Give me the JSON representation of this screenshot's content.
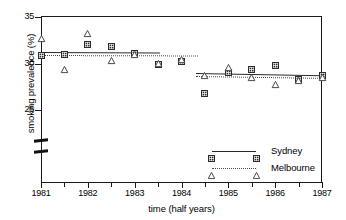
{
  "chart_data": {
    "type": "scatter",
    "title": "",
    "xlabel": "time (half years)",
    "ylabel": "smoking prevalence (%)",
    "xlim": [
      1981,
      1987
    ],
    "ylim": [
      23.2,
      35
    ],
    "y_ticks": [
      25,
      30,
      35
    ],
    "y_tick_labels": [
      "25",
      "30",
      "35"
    ],
    "y_axis_break": true,
    "x_ticks": [
      1981,
      1981.5,
      1982,
      1982.5,
      1983,
      1983.5,
      1984,
      1984.5,
      1985,
      1985.5,
      1986,
      1986.5,
      1987
    ],
    "x_tick_labels": [
      "1981",
      "",
      "1982",
      "",
      "1983",
      "",
      "1984",
      "",
      "1985",
      "",
      "1986",
      "",
      "1987"
    ],
    "x_major_labels": [
      "1981",
      "1982",
      "1983",
      "1984",
      "1985",
      "1986",
      "1987"
    ],
    "grid": false,
    "legend_position": "lower right",
    "series": [
      {
        "name": "Sydney",
        "marker": "square",
        "linestyle": "solid",
        "color": "#2b2b2b",
        "x": [
          1981,
          1981.5,
          1982,
          1982.5,
          1983,
          1983.5,
          1984,
          1984.5,
          1985,
          1985.5,
          1986,
          1986.5,
          1987
        ],
        "y": [
          30.9,
          31.0,
          32.0,
          31.8,
          31.1,
          29.9,
          30.2,
          26.8,
          29.0,
          29.4,
          29.8,
          28.3,
          28.7
        ]
      },
      {
        "name": "Melbourne",
        "marker": "triangle",
        "linestyle": "dotted",
        "color": "#4a4a4a",
        "x": [
          1981,
          1981.5,
          1982,
          1982.5,
          1983,
          1983.5,
          1984,
          1984.5,
          1985,
          1985.5,
          1986,
          1986.5,
          1987
        ],
        "y": [
          32.7,
          29.4,
          33.2,
          30.3,
          31.0,
          30.0,
          30.4,
          28.7,
          29.6,
          28.5,
          27.7,
          28.2,
          28.5
        ]
      }
    ],
    "fitted_lines": [
      {
        "series": "Sydney",
        "segment": 1,
        "linestyle": "solid",
        "x": [
          1981,
          1983.55
        ],
        "y": [
          31.25,
          31.2
        ]
      },
      {
        "series": "Sydney",
        "segment": 2,
        "linestyle": "solid",
        "x": [
          1984.3,
          1987
        ],
        "y": [
          29.0,
          28.75
        ]
      },
      {
        "series": "Melbourne",
        "segment": 1,
        "linestyle": "dotted",
        "x": [
          1981,
          1984.35
        ],
        "y": [
          30.95,
          30.9
        ]
      },
      {
        "series": "Melbourne",
        "segment": 2,
        "linestyle": "dotted",
        "x": [
          1984.3,
          1987
        ],
        "y": [
          28.65,
          28.45
        ]
      }
    ],
    "legend": [
      {
        "label": "Sydney",
        "marker": "square",
        "linestyle": "solid"
      },
      {
        "label": "Melbourne",
        "marker": "triangle",
        "linestyle": "dotted"
      }
    ]
  }
}
